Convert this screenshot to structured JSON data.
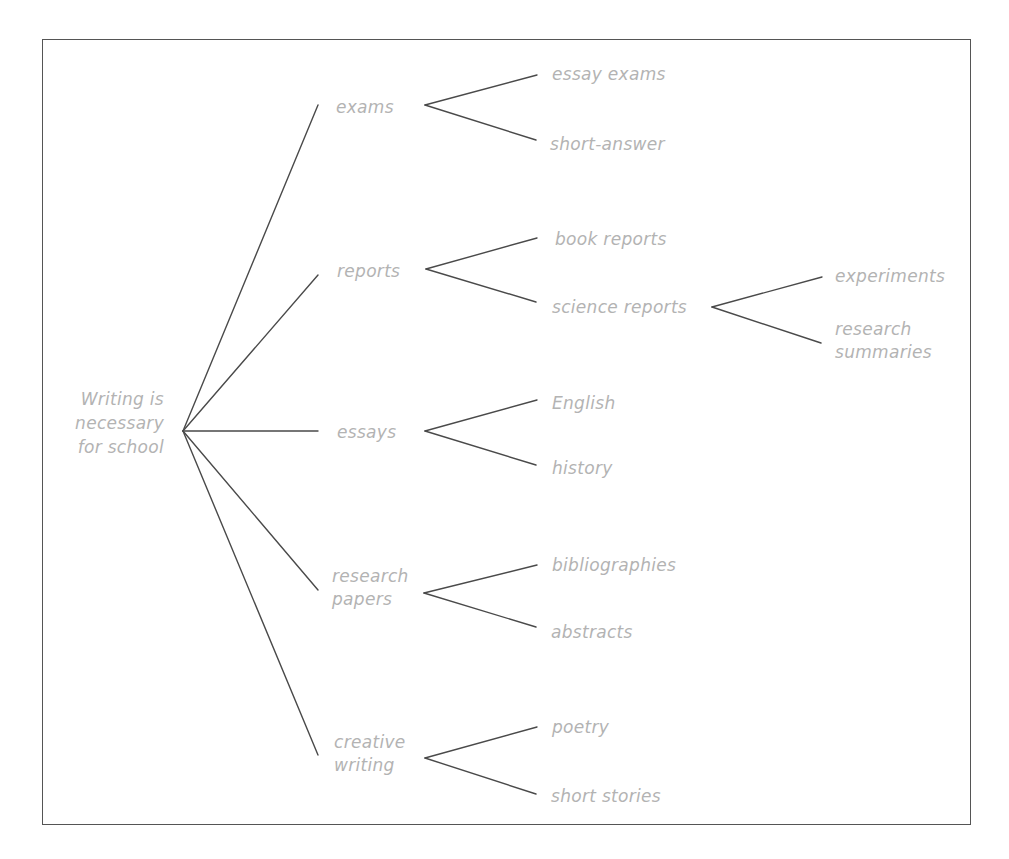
{
  "diagram": {
    "type": "tree",
    "root": {
      "label": "Writing is\nnecessary\nfor school",
      "line1": "Writing is",
      "line2": "necessary",
      "line3": "for school"
    },
    "branches": [
      {
        "label": "exams",
        "children": [
          "essay exams",
          "short-answer"
        ]
      },
      {
        "label": "reports",
        "children": [
          "book reports",
          "science reports"
        ],
        "sub_branches": {
          "science reports": [
            "experiments",
            "research\nsummaries"
          ]
        }
      },
      {
        "label": "essays",
        "children": [
          "English",
          "history"
        ]
      },
      {
        "label": "research\npapers",
        "children": [
          "bibliographies",
          "abstracts"
        ]
      },
      {
        "label": "creative\nwriting",
        "children": [
          "poetry",
          "short stories"
        ]
      }
    ],
    "science_sub": {
      "experiments": "experiments",
      "research_summaries": "research\nsummaries"
    },
    "colors": {
      "text": "#b3b3b3",
      "lines": "#4a4a4a",
      "border": "#555555",
      "background": "#ffffff"
    }
  }
}
